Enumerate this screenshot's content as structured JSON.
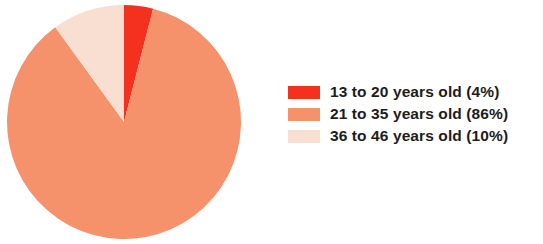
{
  "chart_data": {
    "type": "pie",
    "title": "",
    "subtitle": "",
    "xlabel": "",
    "ylabel": "",
    "grid": false,
    "legend_position": "right",
    "start_angle_deg": 0,
    "direction": "clockwise",
    "center": {
      "x": 124,
      "y": 122
    },
    "radius": 117,
    "categories": [
      "13 to 20 years old",
      "21 to 35 years old",
      "36 to 46 years old"
    ],
    "values": [
      4,
      86,
      10
    ],
    "value_unit": "%",
    "colors": [
      "#F4301F",
      "#F5926B",
      "#F9DFD2"
    ],
    "slices": [
      {
        "label": "13 to 20 years old",
        "value": 4,
        "percent_text": "(4%)",
        "color": "#F4301F",
        "start_angle_deg": 0,
        "end_angle_deg": 14.4
      },
      {
        "label": "21 to 35 years old",
        "value": 86,
        "percent_text": "(86%)",
        "color": "#F5926B",
        "start_angle_deg": 14.4,
        "end_angle_deg": 324.0
      },
      {
        "label": "36 to 46 years old",
        "value": 10,
        "percent_text": "(10%)",
        "color": "#F9DFD2",
        "start_angle_deg": 324.0,
        "end_angle_deg": 360.0
      }
    ],
    "legend_entries": [
      {
        "text": "13 to 20 years old (4%)",
        "color": "#F4301F"
      },
      {
        "text": "21 to 35 years old (86%)",
        "color": "#F5926B"
      },
      {
        "text": "36 to 46 years old (10%)",
        "color": "#F9DFD2"
      }
    ]
  },
  "canvas": {
    "background": "#FFFFFF",
    "width": 543,
    "height": 244
  }
}
